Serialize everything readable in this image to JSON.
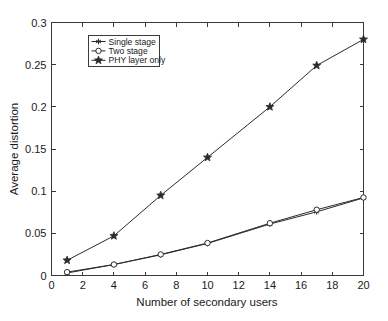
{
  "chart_data": {
    "type": "line",
    "title": "",
    "subtitle": "",
    "xlabel": "Number of secondary users",
    "ylabel": "Average distortion",
    "x": [
      1,
      4,
      7,
      10,
      14,
      17,
      20
    ],
    "xlim": [
      0,
      20
    ],
    "ylim": [
      0,
      0.3
    ],
    "xticks": [
      0,
      2,
      4,
      6,
      8,
      10,
      12,
      14,
      16,
      18,
      20
    ],
    "xticklabels": [
      "0",
      "2",
      "4",
      "6",
      "8",
      "10",
      "12",
      "14",
      "16",
      "18",
      "20"
    ],
    "yticks": [
      0,
      0.05,
      0.1,
      0.15,
      0.2,
      0.25,
      0.3
    ],
    "yticklabels": [
      "0",
      "0.05",
      "0.1",
      "0.15",
      "0.2",
      "0.25",
      "0.3"
    ],
    "grid": false,
    "legend_position": "upper left",
    "series": [
      {
        "name": "Single stage",
        "marker": "asterisk",
        "color": "#2b2b2b",
        "values": [
          0.003,
          0.013,
          0.0245,
          0.038,
          0.061,
          0.0755,
          0.092
        ]
      },
      {
        "name": "Two stage",
        "marker": "circle",
        "color": "#2b2b2b",
        "values": [
          0.004,
          0.013,
          0.025,
          0.0385,
          0.062,
          0.078,
          0.0925
        ]
      },
      {
        "name": "PHY layer only",
        "marker": "star",
        "color": "#2b2b2b",
        "values": [
          0.018,
          0.047,
          0.095,
          0.14,
          0.2,
          0.249,
          0.28
        ]
      }
    ]
  },
  "legend": {
    "entries": [
      {
        "label": "Single stage"
      },
      {
        "label": "Two stage"
      },
      {
        "label": "PHY layer only"
      }
    ]
  },
  "axes": {
    "x_title": "Number of secondary users",
    "y_title": "Average distortion"
  }
}
